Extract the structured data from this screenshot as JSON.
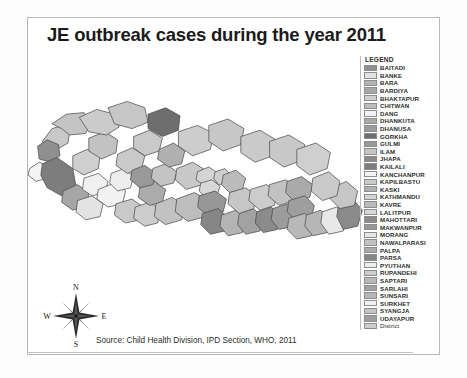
{
  "figure": {
    "title": "JE outbreak cases during the year 2011",
    "source": "Source: Child Health Division, IPD Section, WHO, 2011"
  },
  "compass": {
    "north": "N",
    "east": "E",
    "south": "S",
    "west": "W"
  },
  "legend": {
    "title": "LEGEND",
    "items": [
      {
        "label": "BAITADI",
        "color": "#8f8f8f"
      },
      {
        "label": "BANKE",
        "color": "#e3e3e3"
      },
      {
        "label": "BARA",
        "color": "#b4b4b4"
      },
      {
        "label": "BARDIYA",
        "color": "#a6a6a6"
      },
      {
        "label": "BHAKTAPUR",
        "color": "#cfcfcf"
      },
      {
        "label": "CHITWAN",
        "color": "#bdbdbd"
      },
      {
        "label": "DANG",
        "color": "#f2f2f2"
      },
      {
        "label": "DHANKUTA",
        "color": "#aaaaaa"
      },
      {
        "label": "DHANUSA",
        "color": "#9c9c9c"
      },
      {
        "label": "GORKHA",
        "color": "#6e6e6e"
      },
      {
        "label": "GULMI",
        "color": "#999999"
      },
      {
        "label": "ILAM",
        "color": "#c6c6c6"
      },
      {
        "label": "JHAPA",
        "color": "#8a8a8a"
      },
      {
        "label": "KAILALI",
        "color": "#7d7d7d"
      },
      {
        "label": "KANCHANPUR",
        "color": "#f4f4f4"
      },
      {
        "label": "KAPILBASTU",
        "color": "#c9c9c9"
      },
      {
        "label": "KASKI",
        "color": "#b0b0b0"
      },
      {
        "label": "KATHMANDU",
        "color": "#d4d4d4"
      },
      {
        "label": "KAVRE",
        "color": "#bbbbbb"
      },
      {
        "label": "LALITPUR",
        "color": "#d8d8d8"
      },
      {
        "label": "MAHOTTARI",
        "color": "#8b8b8b"
      },
      {
        "label": "MAKWANPUR",
        "color": "#979797"
      },
      {
        "label": "MORANG",
        "color": "#e8e8e8"
      },
      {
        "label": "NAWALPARASI",
        "color": "#c2c2c2"
      },
      {
        "label": "PALPA",
        "color": "#ababab"
      },
      {
        "label": "PARSA",
        "color": "#868686"
      },
      {
        "label": "PYUTHAN",
        "color": "#ededed"
      },
      {
        "label": "RUPANDEHI",
        "color": "#cccccc"
      },
      {
        "label": "SAPTARI",
        "color": "#b8b8b8"
      },
      {
        "label": "SARLAHI",
        "color": "#a2a2a2"
      },
      {
        "label": "SUNSARI",
        "color": "#b6b6b6"
      },
      {
        "label": "SURKHET",
        "color": "#f0f0f0"
      },
      {
        "label": "SYANGJA",
        "color": "#c4c4c4"
      },
      {
        "label": "UDAYAPUR",
        "color": "#9e9e9e"
      },
      {
        "label": "District",
        "color": "#cdcdcd"
      }
    ]
  },
  "map": {
    "description": "Choropleth map of Nepal districts shaded in grayscale",
    "outline_color": "#4a4a4a",
    "default_fill": "#cfcfcf",
    "regions": [
      {
        "name": "far-west-hill-a",
        "fill": "#c8c8c8",
        "d": "M 18 78 L 30 62 L 44 58 L 52 66 L 50 80 L 36 88 L 22 86 Z"
      },
      {
        "name": "baitadi",
        "fill": "#8f8f8f",
        "d": "M 12 84 L 24 76 L 38 82 L 40 96 L 28 104 L 14 100 Z"
      },
      {
        "name": "far-west-north",
        "fill": "#c4c4c4",
        "d": "M 30 56 L 48 44 L 70 42 L 80 54 L 72 68 L 52 70 L 42 62 Z"
      },
      {
        "name": "kanchanpur",
        "fill": "#f4f4f4",
        "d": "M 2 112 L 14 104 L 26 110 L 24 124 L 10 128 L 0 120 Z"
      },
      {
        "name": "kailali",
        "fill": "#7d7d7d",
        "d": "M 18 106 L 36 98 L 56 112 L 60 134 L 42 146 L 24 136 L 16 120 Z"
      },
      {
        "name": "bardiya",
        "fill": "#a6a6a6",
        "d": "M 44 140 L 62 132 L 76 142 L 74 158 L 56 164 L 42 154 Z"
      },
      {
        "name": "banke",
        "fill": "#e3e3e3",
        "d": "M 62 152 L 80 146 L 94 156 L 90 172 L 72 176 L 60 166 Z"
      },
      {
        "name": "surkhet",
        "fill": "#f0f0f0",
        "d": "M 70 124 L 88 118 L 100 128 L 96 142 L 80 146 L 68 138 Z"
      },
      {
        "name": "mid-west-hill-a",
        "fill": "#cfcfcf",
        "d": "M 56 96 L 74 88 L 90 96 L 88 112 L 70 120 L 56 112 Z"
      },
      {
        "name": "mid-west-hill-b",
        "fill": "#c2c2c2",
        "d": "M 76 74 L 96 66 L 112 76 L 110 92 L 92 100 L 76 90 Z"
      },
      {
        "name": "mid-north-a",
        "fill": "#cbcbcb",
        "d": "M 64 48 L 86 38 L 108 44 L 114 60 L 98 70 L 76 66 Z"
      },
      {
        "name": "mid-north-b",
        "fill": "#c6c6c6",
        "d": "M 100 36 L 124 28 L 146 36 L 150 54 L 130 62 L 108 56 Z"
      },
      {
        "name": "dang",
        "fill": "#f2f2f2",
        "d": "M 88 138 L 108 130 L 122 140 L 118 156 L 100 160 L 86 150 Z"
      },
      {
        "name": "pyuthan",
        "fill": "#ededed",
        "d": "M 104 118 L 120 112 L 132 122 L 128 136 L 112 140 L 102 130 Z"
      },
      {
        "name": "mid-hill-c",
        "fill": "#cacaca",
        "d": "M 112 94 L 130 86 L 146 96 L 142 112 L 124 118 L 110 108 Z"
      },
      {
        "name": "mid-hill-d",
        "fill": "#c9c9c9",
        "d": "M 132 72 L 152 64 L 168 74 L 164 90 L 146 96 L 132 86 Z"
      },
      {
        "name": "gorkha",
        "fill": "#6e6e6e",
        "d": "M 150 44 L 172 36 L 190 46 L 188 64 L 168 72 L 150 62 Z"
      },
      {
        "name": "kapilbastu",
        "fill": "#c9c9c9",
        "d": "M 110 156 L 130 150 L 144 160 L 140 176 L 122 180 L 108 170 Z"
      },
      {
        "name": "rupandehi",
        "fill": "#cccccc",
        "d": "M 134 160 L 152 154 L 166 164 L 162 180 L 146 184 L 132 174 Z"
      },
      {
        "name": "palpa",
        "fill": "#ababab",
        "d": "M 140 134 L 158 128 L 172 138 L 168 154 L 152 158 L 138 148 Z"
      },
      {
        "name": "gulmi",
        "fill": "#999999",
        "d": "M 130 114 L 146 108 L 160 118 L 156 132 L 140 136 L 128 126 Z"
      },
      {
        "name": "syangja",
        "fill": "#c4c4c4",
        "d": "M 156 112 L 172 106 L 186 116 L 182 130 L 166 134 L 154 124 Z"
      },
      {
        "name": "kaski",
        "fill": "#b0b0b0",
        "d": "M 164 88 L 182 80 L 196 90 L 192 106 L 176 110 L 162 100 Z"
      },
      {
        "name": "nawalparasi",
        "fill": "#c2c2c2",
        "d": "M 160 156 L 180 148 L 196 158 L 192 176 L 172 182 L 158 172 Z"
      },
      {
        "name": "chitwan",
        "fill": "#bdbdbd",
        "d": "M 186 150 L 208 142 L 226 152 L 222 172 L 200 178 L 184 166 Z"
      },
      {
        "name": "mid-hill-e",
        "fill": "#c8c8c8",
        "d": "M 186 112 L 206 104 L 222 114 L 218 132 L 198 138 L 184 126 Z"
      },
      {
        "name": "central-north-a",
        "fill": "#cdcdcd",
        "d": "M 188 66 L 212 58 L 232 68 L 228 88 L 206 96 L 188 84 Z"
      },
      {
        "name": "central-north-b",
        "fill": "#c7c7c7",
        "d": "M 226 58 L 250 50 L 270 62 L 266 82 L 244 90 L 226 78 Z"
      },
      {
        "name": "kathmandu",
        "fill": "#d4d4d4",
        "d": "M 212 116 L 226 110 L 238 118 L 236 130 L 222 134 L 210 126 Z"
      },
      {
        "name": "lalitpur",
        "fill": "#d8d8d8",
        "d": "M 216 130 L 230 126 L 240 134 L 236 146 L 222 148 L 214 140 Z"
      },
      {
        "name": "bhaktapur",
        "fill": "#cfcfcf",
        "d": "M 234 116 L 246 112 L 254 120 L 250 130 L 238 132 L 232 124 Z"
      },
      {
        "name": "makwanpur",
        "fill": "#979797",
        "d": "M 214 146 L 234 140 L 248 150 L 244 166 L 226 172 L 212 160 Z"
      },
      {
        "name": "kavre",
        "fill": "#bbbbbb",
        "d": "M 244 120 L 260 114 L 272 124 L 268 138 L 252 142 L 242 132 Z"
      },
      {
        "name": "parsa",
        "fill": "#868686",
        "d": "M 218 168 L 238 162 L 250 174 L 246 190 L 228 194 L 216 182 Z"
      },
      {
        "name": "bara",
        "fill": "#b4b4b4",
        "d": "M 242 170 L 260 164 L 272 176 L 268 192 L 250 196 L 240 184 Z"
      },
      {
        "name": "sarlahi",
        "fill": "#a2a2a2",
        "d": "M 264 168 L 282 162 L 294 174 L 290 190 L 272 194 L 262 182 Z"
      },
      {
        "name": "mahottari",
        "fill": "#8b8b8b",
        "d": "M 286 166 L 304 160 L 316 172 L 312 188 L 294 192 L 284 180 Z"
      },
      {
        "name": "dhanusa",
        "fill": "#9c9c9c",
        "d": "M 306 162 L 324 156 L 336 168 L 332 184 L 314 188 L 304 176 Z"
      },
      {
        "name": "central-hill-f",
        "fill": "#c6c6c6",
        "d": "M 252 142 L 272 136 L 286 146 L 282 162 L 264 168 L 250 156 Z"
      },
      {
        "name": "east-hill-a",
        "fill": "#cccccc",
        "d": "M 278 138 L 298 132 L 312 142 L 308 158 L 290 164 L 276 152 Z"
      },
      {
        "name": "east-hill-b",
        "fill": "#c2c2c2",
        "d": "M 302 132 L 322 126 L 336 136 L 332 152 L 314 158 L 300 146 Z"
      },
      {
        "name": "east-north-a",
        "fill": "#cacaca",
        "d": "M 266 72 L 290 64 L 310 76 L 306 96 L 284 104 L 266 92 Z"
      },
      {
        "name": "east-north-b",
        "fill": "#c8c8c8",
        "d": "M 302 78 L 326 70 L 346 82 L 342 102 L 320 110 L 302 98 Z"
      },
      {
        "name": "east-north-c",
        "fill": "#cfcfcf",
        "d": "M 336 88 L 360 80 L 378 92 L 374 112 L 352 120 L 336 108 Z"
      },
      {
        "name": "dhankuta",
        "fill": "#aaaaaa",
        "d": "M 324 128 L 342 122 L 356 132 L 352 148 L 334 154 L 322 142 Z"
      },
      {
        "name": "udayapur",
        "fill": "#9e9e9e",
        "d": "M 326 152 L 346 146 L 358 158 L 354 174 L 336 178 L 324 166 Z"
      },
      {
        "name": "saptari",
        "fill": "#b8b8b8",
        "d": "M 326 174 L 346 168 L 358 180 L 354 196 L 336 200 L 324 188 Z"
      },
      {
        "name": "sunsari",
        "fill": "#b6b6b6",
        "d": "M 348 170 L 366 164 L 378 176 L 374 192 L 356 196 L 346 184 Z"
      },
      {
        "name": "morang",
        "fill": "#e8e8e8",
        "d": "M 368 166 L 386 160 L 398 172 L 394 190 L 376 194 L 366 180 Z"
      },
      {
        "name": "jhapa",
        "fill": "#8a8a8a",
        "d": "M 388 158 L 406 150 L 418 164 L 412 184 L 394 188 L 386 172 Z"
      },
      {
        "name": "ilam",
        "fill": "#c6c6c6",
        "d": "M 380 136 L 398 128 L 412 140 L 408 158 L 390 162 L 378 150 Z"
      },
      {
        "name": "east-hill-c",
        "fill": "#cacaca",
        "d": "M 356 124 L 376 116 L 390 128 L 386 146 L 368 152 L 354 140 Z"
      }
    ]
  }
}
